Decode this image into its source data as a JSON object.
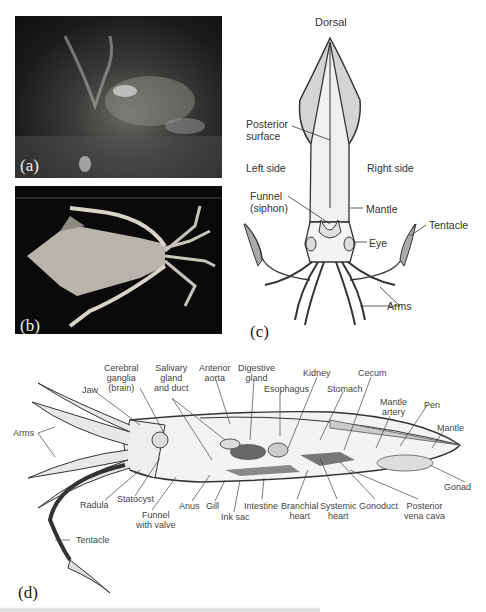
{
  "panels": {
    "a": {
      "label": "(a)",
      "description": "Photograph of deep-sea squid on seafloor"
    },
    "b": {
      "label": "(b)",
      "description": "Photograph of squid specimen on black background"
    },
    "c": {
      "label": "(c)",
      "labels": {
        "dorsal": "Dorsal",
        "posterior_surface": "Posterior\nsurface",
        "posterior": "Posterior",
        "surface": "surface",
        "left_side": "Left side",
        "right_side": "Right side",
        "funnel": "Funnel",
        "siphon": "(siphon)",
        "mantle": "Mantle",
        "eye": "Eye",
        "tentacle": "Tentacle",
        "arms": "Arms"
      }
    },
    "d": {
      "label": "(d)",
      "labels": {
        "cerebral": "Cerebral",
        "ganglia": "ganglia",
        "brain": "(brain)",
        "jaw": "Jaw",
        "salivary": "Salivary",
        "gland": "gland",
        "and_duct": "and duct",
        "anterior": "Anterior",
        "aorta": "aorta",
        "digestive": "Digestive",
        "digestive_gland": "gland",
        "esophagus": "Esophagus",
        "kidney": "Kidney",
        "stomach": "Stomach",
        "cecum": "Cecum",
        "mantle_artery_1": "Mantle",
        "mantle_artery_2": "artery",
        "pen": "Pen",
        "mantle": "Mantle",
        "arms": "Arms",
        "radula": "Radula",
        "statocyst": "Statocyst",
        "funnel_1": "Funnel",
        "funnel_2": "with valve",
        "anus": "Anus",
        "gill": "Gill",
        "ink_sac": "Ink sac",
        "intestine": "Intestine",
        "branchial_1": "Branchial",
        "branchial_2": "heart",
        "systemic_1": "Systemic",
        "systemic_2": "heart",
        "gonoduct": "Gonoduct",
        "posterior_vc_1": "Posterior",
        "posterior_vc_2": "vena cava",
        "gonad": "Gonad",
        "tentacle": "Tentacle"
      }
    }
  }
}
